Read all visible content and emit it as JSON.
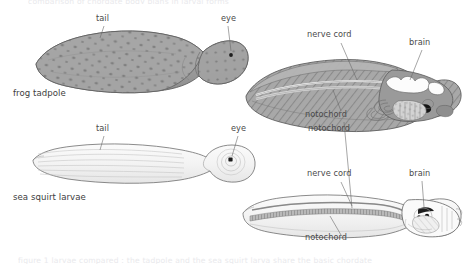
{
  "figure": {
    "title_cropped_top": "comparison of chordate body plans in larval forms",
    "caption_cropped_bottom": "figure 1  larvae compared : the tadpole and the sea squirt larva share the basic chordate",
    "background_color": "#ffffff",
    "ink_color": "#4a4a4a",
    "tissue_fill": "#9e9e9e",
    "pale_fill": "#f4f4f4"
  },
  "organisms": [
    {
      "id": "frog-tadpole",
      "name": "frog tadpole",
      "views": [
        {
          "id": "frog-tadpole-external",
          "kind": "external",
          "labels": [
            {
              "text": "tail",
              "x": 96,
              "y": 18
            },
            {
              "text": "eye",
              "x": 222,
              "y": 18
            }
          ]
        },
        {
          "id": "frog-tadpole-cutaway",
          "kind": "cutaway",
          "labels": [
            {
              "text": "nerve cord",
              "x": 308,
              "y": 33
            },
            {
              "text": "brain",
              "x": 411,
              "y": 41
            },
            {
              "text": "notochord",
              "x": 305,
              "y": 113
            }
          ]
        }
      ]
    },
    {
      "id": "sea-squirt-larvae",
      "name": "sea squirt larvae",
      "views": [
        {
          "id": "sea-squirt-external",
          "kind": "external",
          "labels": [
            {
              "text": "tail",
              "x": 96,
              "y": 128
            },
            {
              "text": "eye",
              "x": 232,
              "y": 128
            }
          ]
        },
        {
          "id": "sea-squirt-cutaway",
          "kind": "cutaway",
          "labels": [
            {
              "text": "notochord",
              "x": 309,
              "y": 128
            },
            {
              "text": "nerve cord",
              "x": 308,
              "y": 172
            },
            {
              "text": "brain",
              "x": 411,
              "y": 172
            },
            {
              "text": "notochord",
              "x": 305,
              "y": 237
            }
          ]
        }
      ]
    }
  ],
  "row_labels": [
    {
      "id": "row-label-frog",
      "text": "frog tadpole",
      "x": 13,
      "y": 90
    },
    {
      "id": "row-label-seasquirt",
      "text": "sea squirt larvae",
      "x": 13,
      "y": 194
    }
  ],
  "annotation_labels": {
    "tail_1": "tail",
    "eye_1": "eye",
    "nerve_cord_1": "nerve cord",
    "brain_1": "brain",
    "notochord_1": "notochord",
    "tail_2": "tail",
    "eye_2": "eye",
    "notochord_2": "notochord",
    "nerve_cord_2": "nerve cord",
    "brain_2": "brain",
    "notochord_3": "notochord"
  }
}
